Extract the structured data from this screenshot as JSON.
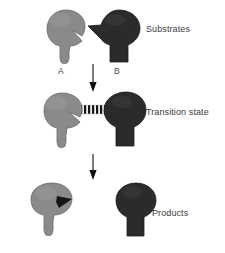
{
  "figure": {
    "type": "biochemistry-reaction-schematic",
    "background_color": "#ffffff"
  },
  "colors": {
    "substrate_a_fill": "#8a8a8a",
    "substrate_a_stroke": "#6f6f6f",
    "substrate_b_fill": "#2b2b2b",
    "substrate_b_stroke": "#1a1a1a",
    "bond_dark": "#111111",
    "bond_light": "#e8e8e8",
    "arrow": "#111111",
    "text": "#3a3a3a"
  },
  "rows": [
    {
      "id": "substrates",
      "label": "Substrates",
      "label_position": "right",
      "molecules": [
        {
          "id": "substrate-a",
          "label": "A",
          "color": "#8a8a8a",
          "shape": "notched-keyhole",
          "description": "gray rounded head with wedge notch cut from right side and tapered stem"
        },
        {
          "id": "substrate-b",
          "label": "B",
          "color": "#2b2b2b",
          "shape": "beaked-keyhole",
          "description": "dark oval head with pointed beak on left and rectangular stem"
        }
      ]
    },
    {
      "id": "transition-state",
      "label": "Transition state",
      "label_position": "right",
      "molecules": [
        {
          "id": "transition-a",
          "label": "",
          "color": "#8a8a8a",
          "shape": "notched-keyhole",
          "description": "gray molecule A bonded at its notch"
        },
        {
          "id": "transition-bond",
          "label": "",
          "color": "#111111",
          "shape": "hatched-bond",
          "description": "striped transition bond linking A and B"
        },
        {
          "id": "transition-b",
          "label": "",
          "color": "#2b2b2b",
          "shape": "keyhole",
          "description": "dark molecule B bonded on its left edge"
        }
      ]
    },
    {
      "id": "products",
      "label": "Products",
      "label_position": "right",
      "molecules": [
        {
          "id": "product-a",
          "label": "",
          "color": "#8a8a8a",
          "shape": "notched-keyhole-filled",
          "description": "gray molecule A with dark wedge now occupying the notch"
        },
        {
          "id": "product-b",
          "label": "",
          "color": "#2b2b2b",
          "shape": "keyhole",
          "description": "dark molecule B with the beak group removed"
        }
      ]
    }
  ],
  "arrows": [
    {
      "id": "arrow-substrates-to-transition",
      "direction": "down",
      "from": "substrates",
      "to": "transition-state"
    },
    {
      "id": "arrow-transition-to-products",
      "direction": "down",
      "from": "transition-state",
      "to": "products"
    }
  ],
  "labels": {
    "substrates": "Substrates",
    "transition_state": "Transition state",
    "products": "Products",
    "molecule_a": "A",
    "molecule_b": "B"
  }
}
